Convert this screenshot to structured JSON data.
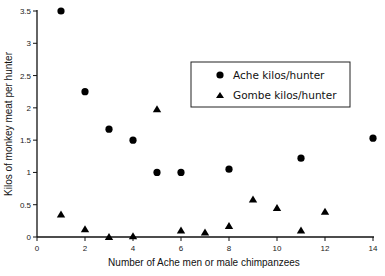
{
  "chart_data": {
    "type": "scatter",
    "title": "",
    "xlabel": "Number of Ache men or male chimpanzees",
    "ylabel": "Kilos of monkey meat per hunter",
    "xlim": [
      0,
      14
    ],
    "ylim": [
      0,
      3.5
    ],
    "xticks": [
      0,
      2,
      4,
      6,
      8,
      10,
      12,
      14
    ],
    "yticks": [
      0,
      0.5,
      1,
      1.5,
      2,
      2.5,
      3,
      3.5
    ],
    "xtick_labels": [
      "0",
      "2",
      "4",
      "6",
      "8",
      "10",
      "12",
      "14"
    ],
    "ytick_labels": [
      "0",
      "0.5",
      "1",
      "1.5",
      "2",
      "2.5",
      "3",
      "3.5"
    ],
    "grid": false,
    "legend_position": "upper right (inset box)",
    "series": [
      {
        "name": "Ache kilos/hunter",
        "marker": "circle",
        "color": "#000000",
        "points": [
          {
            "x": 1,
            "y": 3.5
          },
          {
            "x": 2,
            "y": 2.25
          },
          {
            "x": 3,
            "y": 1.67
          },
          {
            "x": 4,
            "y": 1.5
          },
          {
            "x": 5,
            "y": 1.0
          },
          {
            "x": 6,
            "y": 1.0
          },
          {
            "x": 8,
            "y": 1.05
          },
          {
            "x": 11,
            "y": 1.22
          },
          {
            "x": 14,
            "y": 1.53
          }
        ]
      },
      {
        "name": "Gombe kilos/hunter",
        "marker": "triangle",
        "color": "#000000",
        "points": [
          {
            "x": 1,
            "y": 0.35
          },
          {
            "x": 2,
            "y": 0.12
          },
          {
            "x": 3,
            "y": 0.0
          },
          {
            "x": 4,
            "y": 0.01
          },
          {
            "x": 5,
            "y": 1.98
          },
          {
            "x": 6,
            "y": 0.1
          },
          {
            "x": 7,
            "y": 0.07
          },
          {
            "x": 8,
            "y": 0.17
          },
          {
            "x": 9,
            "y": 0.58
          },
          {
            "x": 10,
            "y": 0.45
          },
          {
            "x": 11,
            "y": 0.1
          },
          {
            "x": 12,
            "y": 0.39
          }
        ]
      }
    ]
  },
  "legend": {
    "items": [
      {
        "label": "Ache kilos/hunter",
        "marker": "circle"
      },
      {
        "label": "Gombe kilos/hunter",
        "marker": "triangle"
      }
    ]
  }
}
